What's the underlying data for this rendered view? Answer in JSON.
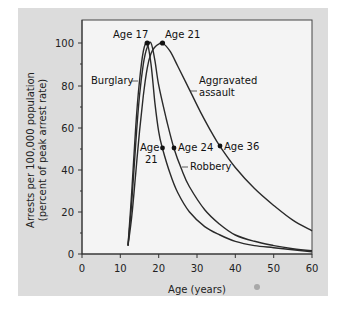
{
  "chart_data": {
    "type": "line",
    "title": "",
    "xlabel": "Age (years)",
    "ylabel": "Arrests per 100,000 population (percent of peak arrest rate)",
    "ylabel_lines": [
      "Arrests per 100,000 population",
      "(percent of peak arrest rate)"
    ],
    "xlim": [
      0,
      60
    ],
    "ylim": [
      0,
      105
    ],
    "x_ticks": [
      0,
      10,
      20,
      30,
      40,
      50,
      60
    ],
    "y_ticks": [
      0,
      20,
      40,
      60,
      80,
      100
    ],
    "grid": false,
    "legend": "inline labels",
    "estimated": true,
    "series": [
      {
        "name": "Burglary",
        "x": [
          12,
          13,
          14,
          15,
          16,
          17,
          18,
          19,
          20,
          21,
          23,
          25,
          28,
          32,
          36,
          40,
          45,
          50,
          55,
          60
        ],
        "values": [
          4,
          30,
          60,
          82,
          96,
          100,
          90,
          72,
          58,
          50,
          38,
          29,
          20,
          13,
          9,
          6,
          4,
          3,
          2,
          1
        ]
      },
      {
        "name": "Robbery",
        "x": [
          12,
          13,
          14,
          15,
          16,
          17,
          18,
          19,
          20,
          22,
          24,
          26,
          28,
          32,
          36,
          40,
          45,
          50,
          55,
          60
        ],
        "values": [
          4,
          25,
          52,
          75,
          90,
          98,
          100,
          92,
          80,
          64,
          50,
          40,
          32,
          21,
          14,
          9,
          6,
          4,
          2.5,
          1.5
        ]
      },
      {
        "name": "Aggravated assault",
        "x": [
          12,
          13,
          14,
          15,
          16,
          17,
          18,
          19,
          20,
          21,
          23,
          25,
          28,
          31,
          34,
          36,
          40,
          45,
          50,
          55,
          60
        ],
        "values": [
          4,
          18,
          38,
          58,
          75,
          88,
          95,
          98,
          99.5,
          100,
          96,
          89,
          78,
          67,
          57,
          51,
          41,
          31,
          23,
          16,
          11
        ]
      }
    ],
    "annotations": [
      {
        "text": "Age 17",
        "series": "Burglary",
        "x": 17,
        "y": 100,
        "role": "peak"
      },
      {
        "text": "Age 21",
        "series": "Aggravated assault",
        "x": 21,
        "y": 100,
        "role": "peak"
      },
      {
        "text": "Age 21",
        "series": "Burglary",
        "x": 21,
        "y": 50,
        "role": "half-peak"
      },
      {
        "text": "Age 24",
        "series": "Robbery",
        "x": 24,
        "y": 50,
        "role": "half-peak"
      },
      {
        "text": "Age 36",
        "series": "Aggravated assault",
        "x": 36,
        "y": 51,
        "role": "half-peak"
      }
    ],
    "series_labels": {
      "burglary": "Burglary",
      "robbery": "Robbery",
      "assault_line1": "Aggravated",
      "assault_line2": "assault"
    },
    "ann_text": {
      "age17": "Age 17",
      "age21_peak": "Age 21",
      "age21_half_line1": "Age",
      "age21_half_line2": "21",
      "age24": "Age 24",
      "age36": "Age 36"
    },
    "tick_text": {
      "x": [
        "0",
        "10",
        "20",
        "30",
        "40",
        "50",
        "60"
      ],
      "y": [
        "0",
        "20",
        "40",
        "60",
        "80",
        "100"
      ]
    },
    "colors": {
      "panel": "#dcdcdc",
      "plot_bg": "#f4f4f4",
      "line": "#2a2a2a",
      "line_light": "#666666"
    }
  }
}
